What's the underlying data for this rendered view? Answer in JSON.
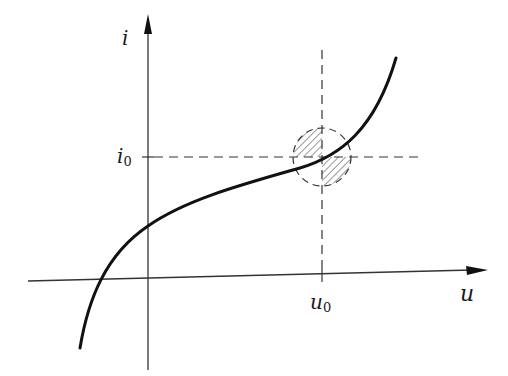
{
  "diagram": {
    "type": "characteristic-curve",
    "colors": {
      "ink": "#1a1a1a",
      "background": "#ffffff"
    },
    "axes": {
      "vertical": {
        "label": "i"
      },
      "horizontal": {
        "label": "u"
      }
    },
    "operating_point": {
      "i_label": "i",
      "i_sub": "0",
      "u_label": "u",
      "u_sub": "0"
    },
    "annotations": {
      "circle": "dashed circle around operating point",
      "hatched_regions": [
        "upper-left quadrant",
        "lower-right quadrant"
      ]
    }
  }
}
